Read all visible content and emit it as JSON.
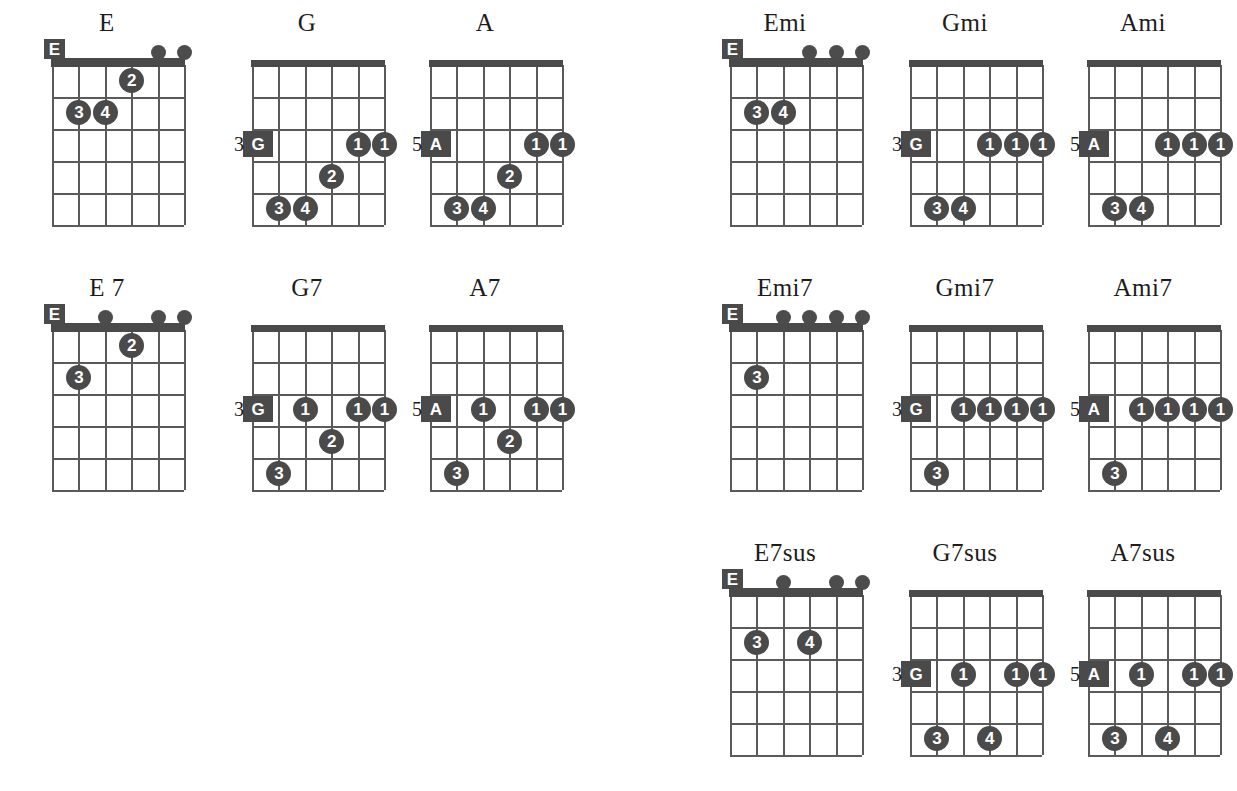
{
  "page": {
    "kind": "guitar-chord-chart",
    "strings": 6,
    "frets": 5,
    "ink_color": "#4a4a4a",
    "text_color": "#1c1c1c"
  },
  "chords": [
    {
      "name": "E",
      "title": "E",
      "x": 12,
      "y": 10,
      "open_position": true,
      "root_label": "E",
      "root_string": 6,
      "fret_number": "",
      "open_strings": [
        2,
        1
      ],
      "fingers": [
        {
          "label": "2",
          "string": 3,
          "fret": 1
        },
        {
          "label": "3",
          "string": 5,
          "fret": 2
        },
        {
          "label": "4",
          "string": 4,
          "fret": 2
        }
      ]
    },
    {
      "name": "G",
      "title": "G",
      "x": 212,
      "y": 10,
      "open_position": false,
      "root_label": "G",
      "root_string": 6,
      "root_fret": 3,
      "fret_number": "3",
      "open_strings": [],
      "fingers": [
        {
          "label": "1",
          "string": 2,
          "fret": 3
        },
        {
          "label": "1",
          "string": 1,
          "fret": 3
        },
        {
          "label": "2",
          "string": 3,
          "fret": 4
        },
        {
          "label": "3",
          "string": 5,
          "fret": 5
        },
        {
          "label": "4",
          "string": 4,
          "fret": 5
        }
      ]
    },
    {
      "name": "A",
      "title": "A",
      "x": 390,
      "y": 10,
      "open_position": false,
      "root_label": "A",
      "root_string": 6,
      "root_fret": 3,
      "fret_number": "5",
      "open_strings": [],
      "fingers": [
        {
          "label": "1",
          "string": 2,
          "fret": 3
        },
        {
          "label": "1",
          "string": 1,
          "fret": 3
        },
        {
          "label": "2",
          "string": 3,
          "fret": 4
        },
        {
          "label": "3",
          "string": 5,
          "fret": 5
        },
        {
          "label": "4",
          "string": 4,
          "fret": 5
        }
      ]
    },
    {
      "name": "Emi",
      "title": "Emi",
      "x": 690,
      "y": 10,
      "open_position": true,
      "root_label": "E",
      "root_string": 6,
      "fret_number": "",
      "open_strings": [
        3,
        2,
        1
      ],
      "fingers": [
        {
          "label": "3",
          "string": 5,
          "fret": 2
        },
        {
          "label": "4",
          "string": 4,
          "fret": 2
        }
      ]
    },
    {
      "name": "Gmi",
      "title": "Gmi",
      "x": 870,
      "y": 10,
      "open_position": false,
      "root_label": "G",
      "root_string": 6,
      "root_fret": 3,
      "fret_number": "3",
      "open_strings": [],
      "fingers": [
        {
          "label": "1",
          "string": 3,
          "fret": 3
        },
        {
          "label": "1",
          "string": 2,
          "fret": 3
        },
        {
          "label": "1",
          "string": 1,
          "fret": 3
        },
        {
          "label": "3",
          "string": 5,
          "fret": 5
        },
        {
          "label": "4",
          "string": 4,
          "fret": 5
        }
      ]
    },
    {
      "name": "Ami",
      "title": "Ami",
      "x": 1048,
      "y": 10,
      "open_position": false,
      "root_label": "A",
      "root_string": 6,
      "root_fret": 3,
      "fret_number": "5",
      "open_strings": [],
      "fingers": [
        {
          "label": "1",
          "string": 3,
          "fret": 3
        },
        {
          "label": "1",
          "string": 2,
          "fret": 3
        },
        {
          "label": "1",
          "string": 1,
          "fret": 3
        },
        {
          "label": "3",
          "string": 5,
          "fret": 5
        },
        {
          "label": "4",
          "string": 4,
          "fret": 5
        }
      ]
    },
    {
      "name": "E7",
      "title": "E 7",
      "x": 12,
      "y": 275,
      "open_position": true,
      "root_label": "E",
      "root_string": 6,
      "fret_number": "",
      "open_strings": [
        4,
        2,
        1
      ],
      "fingers": [
        {
          "label": "2",
          "string": 3,
          "fret": 1
        },
        {
          "label": "3",
          "string": 5,
          "fret": 2
        }
      ]
    },
    {
      "name": "G7",
      "title": "G7",
      "x": 212,
      "y": 275,
      "open_position": false,
      "root_label": "G",
      "root_string": 6,
      "root_fret": 3,
      "fret_number": "3",
      "open_strings": [],
      "fingers": [
        {
          "label": "1",
          "string": 4,
          "fret": 3
        },
        {
          "label": "1",
          "string": 2,
          "fret": 3
        },
        {
          "label": "1",
          "string": 1,
          "fret": 3
        },
        {
          "label": "2",
          "string": 3,
          "fret": 4
        },
        {
          "label": "3",
          "string": 5,
          "fret": 5
        }
      ]
    },
    {
      "name": "A7",
      "title": "A7",
      "x": 390,
      "y": 275,
      "open_position": false,
      "root_label": "A",
      "root_string": 6,
      "root_fret": 3,
      "fret_number": "5",
      "open_strings": [],
      "fingers": [
        {
          "label": "1",
          "string": 4,
          "fret": 3
        },
        {
          "label": "1",
          "string": 2,
          "fret": 3
        },
        {
          "label": "1",
          "string": 1,
          "fret": 3
        },
        {
          "label": "2",
          "string": 3,
          "fret": 4
        },
        {
          "label": "3",
          "string": 5,
          "fret": 5
        }
      ]
    },
    {
      "name": "Emi7",
      "title": "Emi7",
      "x": 690,
      "y": 275,
      "open_position": true,
      "root_label": "E",
      "root_string": 6,
      "fret_number": "",
      "open_strings": [
        4,
        3,
        2,
        1
      ],
      "fingers": [
        {
          "label": "3",
          "string": 5,
          "fret": 2
        }
      ]
    },
    {
      "name": "Gmi7",
      "title": "Gmi7",
      "x": 870,
      "y": 275,
      "open_position": false,
      "root_label": "G",
      "root_string": 6,
      "root_fret": 3,
      "fret_number": "3",
      "open_strings": [],
      "fingers": [
        {
          "label": "1",
          "string": 4,
          "fret": 3
        },
        {
          "label": "1",
          "string": 3,
          "fret": 3
        },
        {
          "label": "1",
          "string": 2,
          "fret": 3
        },
        {
          "label": "1",
          "string": 1,
          "fret": 3
        },
        {
          "label": "3",
          "string": 5,
          "fret": 5
        }
      ]
    },
    {
      "name": "Ami7",
      "title": "Ami7",
      "x": 1048,
      "y": 275,
      "open_position": false,
      "root_label": "A",
      "root_string": 6,
      "root_fret": 3,
      "fret_number": "5",
      "open_strings": [],
      "fingers": [
        {
          "label": "1",
          "string": 4,
          "fret": 3
        },
        {
          "label": "1",
          "string": 3,
          "fret": 3
        },
        {
          "label": "1",
          "string": 2,
          "fret": 3
        },
        {
          "label": "1",
          "string": 1,
          "fret": 3
        },
        {
          "label": "3",
          "string": 5,
          "fret": 5
        }
      ]
    },
    {
      "name": "E7sus",
      "title": "E7sus",
      "x": 690,
      "y": 540,
      "open_position": true,
      "root_label": "E",
      "root_string": 6,
      "fret_number": "",
      "open_strings": [
        4,
        2,
        1
      ],
      "fingers": [
        {
          "label": "3",
          "string": 5,
          "fret": 2
        },
        {
          "label": "4",
          "string": 3,
          "fret": 2
        }
      ]
    },
    {
      "name": "G7sus",
      "title": "G7sus",
      "x": 870,
      "y": 540,
      "open_position": false,
      "root_label": "G",
      "root_string": 6,
      "root_fret": 3,
      "fret_number": "3",
      "open_strings": [],
      "fingers": [
        {
          "label": "1",
          "string": 4,
          "fret": 3
        },
        {
          "label": "1",
          "string": 2,
          "fret": 3
        },
        {
          "label": "1",
          "string": 1,
          "fret": 3
        },
        {
          "label": "3",
          "string": 5,
          "fret": 5
        },
        {
          "label": "4",
          "string": 3,
          "fret": 5
        }
      ]
    },
    {
      "name": "A7sus",
      "title": "A7sus",
      "x": 1048,
      "y": 540,
      "open_position": false,
      "root_label": "A",
      "root_string": 6,
      "root_fret": 3,
      "fret_number": "5",
      "open_strings": [],
      "fingers": [
        {
          "label": "1",
          "string": 4,
          "fret": 3
        },
        {
          "label": "1",
          "string": 2,
          "fret": 3
        },
        {
          "label": "1",
          "string": 1,
          "fret": 3
        },
        {
          "label": "3",
          "string": 5,
          "fret": 5
        },
        {
          "label": "4",
          "string": 3,
          "fret": 5
        }
      ]
    }
  ]
}
